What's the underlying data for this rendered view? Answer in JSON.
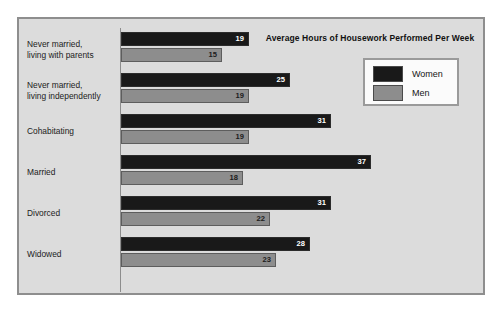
{
  "chart_data": {
    "type": "bar",
    "orientation": "horizontal",
    "title": "Average Hours of Housework Performed Per Week",
    "xlabel": "",
    "ylabel": "",
    "grid": false,
    "legend_position": "top-right",
    "xlim": [
      0,
      40
    ],
    "categories": [
      "Never married,\nliving with parents",
      "Never married,\nliving independently",
      "Cohabitating",
      "Married",
      "Divorced",
      "Widowed"
    ],
    "series": [
      {
        "name": "Women",
        "color": "#191919",
        "values": [
          19,
          25,
          31,
          37,
          31,
          28
        ]
      },
      {
        "name": "Men",
        "color": "#8d8d8d",
        "values": [
          15,
          19,
          19,
          18,
          22,
          23
        ]
      }
    ]
  },
  "legend": {
    "entries": [
      {
        "label": "Women",
        "color": "#191919"
      },
      {
        "label": "Men",
        "color": "#8d8d8d"
      }
    ]
  },
  "colors": {
    "frame_background": "#dcdcdc",
    "frame_border": "#8e8e8e",
    "page_background": "#ffffff",
    "women_bar": "#191919",
    "men_bar": "#8d8d8d",
    "axis_line": "#8d8d8d",
    "legend_background": "#fbfbfb"
  }
}
